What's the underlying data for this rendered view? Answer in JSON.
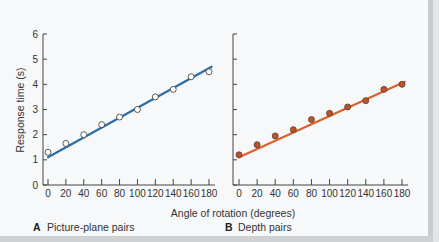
{
  "chart_data": [
    {
      "type": "scatter",
      "panel": "A",
      "caption": "Picture-plane pairs",
      "title": "",
      "xlabel": "Angle of rotation (degrees)",
      "ylabel": "Response time (s)",
      "x": [
        0,
        20,
        40,
        60,
        80,
        100,
        120,
        140,
        160,
        180
      ],
      "y": [
        1.3,
        1.65,
        2.0,
        2.4,
        2.7,
        3.0,
        3.5,
        3.8,
        4.3,
        4.5
      ],
      "fit_line": {
        "x0": 0,
        "y0": 1.1,
        "x1": 183,
        "y1": 4.7
      },
      "xlim": [
        0,
        180
      ],
      "ylim": [
        0,
        6
      ],
      "xticks": [
        0,
        20,
        40,
        60,
        80,
        100,
        120,
        140,
        160,
        180
      ],
      "yticks": [
        0,
        1,
        2,
        3,
        4,
        5,
        6
      ],
      "marker": "open-circle",
      "color": "#2a6ea6",
      "grid": false,
      "legend": null
    },
    {
      "type": "scatter",
      "panel": "B",
      "caption": "Depth pairs",
      "title": "",
      "xlabel": "Angle of rotation (degrees)",
      "ylabel": "Response time (s)",
      "x": [
        0,
        20,
        40,
        60,
        80,
        100,
        120,
        140,
        160,
        180
      ],
      "y": [
        1.2,
        1.6,
        1.95,
        2.2,
        2.6,
        2.85,
        3.1,
        3.35,
        3.8,
        4.0
      ],
      "fit_line": {
        "x0": 0,
        "y0": 1.1,
        "x1": 183,
        "y1": 4.1
      },
      "xlim": [
        0,
        180
      ],
      "ylim": [
        0,
        6
      ],
      "xticks": [
        0,
        20,
        40,
        60,
        80,
        100,
        120,
        140,
        160,
        180
      ],
      "yticks": [
        0,
        1,
        2,
        3,
        4,
        5,
        6
      ],
      "marker": "filled-circle",
      "color": "#d9622b",
      "marker_fill": "#b5572f",
      "grid": false,
      "legend": null
    }
  ],
  "labels": {
    "ylabel": "Response time (s)",
    "xlabel": "Angle of rotation (degrees)",
    "panel_a_letter": "A",
    "panel_a_caption": "Picture-plane pairs",
    "panel_b_letter": "B",
    "panel_b_caption": "Depth pairs"
  },
  "colors": {
    "panel_a_line": "#2a6ea6",
    "panel_b_line": "#d9622b",
    "panel_b_marker": "#b5572f",
    "axis": "#444444"
  }
}
